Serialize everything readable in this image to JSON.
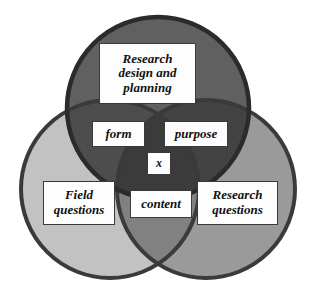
{
  "diagram": {
    "type": "venn",
    "title": "",
    "background_color": "#ffffff",
    "stroke_color": "#3a3a3a",
    "stroke_width": 4,
    "circles": [
      {
        "id": "research-design-circle",
        "name": "Research design and planning",
        "cx": 158,
        "cy": 108,
        "r": 91,
        "fill": "#606060",
        "shade_label": "dark gray"
      },
      {
        "id": "field-questions-circle",
        "name": "Field questions",
        "cx": 110,
        "cy": 189,
        "r": 89,
        "fill": "#c2c2c2",
        "shade_label": "light gray"
      },
      {
        "id": "research-questions-circle",
        "name": "Research questions",
        "cx": 206,
        "cy": 189,
        "r": 89,
        "fill": "#9a9a9a",
        "shade_label": "medium gray"
      }
    ],
    "overlap_fills": {
      "top_left": "#4d4d4d",
      "top_right": "#434343",
      "bottom_left_right": "#818181",
      "center_triple": "#3b3b3b"
    }
  },
  "labels": {
    "research_design": {
      "id": "research-design-label",
      "region": "Research design and planning circle only",
      "lines": [
        "Research",
        "design and",
        "planning"
      ]
    },
    "form": {
      "id": "form-label",
      "region": "Research design and planning ∩ Field questions",
      "lines": [
        "form"
      ]
    },
    "purpose": {
      "id": "purpose-label",
      "region": "Research design and planning ∩ Research questions",
      "lines": [
        "purpose"
      ]
    },
    "x": {
      "id": "x-label",
      "region": "triple intersection",
      "lines": [
        "x"
      ]
    },
    "field_questions": {
      "id": "field-questions-label",
      "region": "Field questions circle only",
      "lines": [
        "Field",
        "questions"
      ]
    },
    "research_questions": {
      "id": "research-questions-label",
      "region": "Research questions circle only",
      "lines": [
        "Research",
        "questions"
      ]
    },
    "content": {
      "id": "content-label",
      "region": "Field questions ∩ Research questions",
      "lines": [
        "content"
      ]
    }
  }
}
